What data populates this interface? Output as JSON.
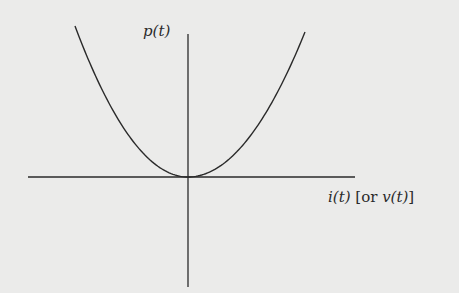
{
  "chart_data": {
    "type": "line",
    "title": "",
    "xlabel": "i(t) [or v(t)]",
    "ylabel": "p(t)",
    "xlabel_parts": {
      "main": "i(t)",
      "bracket_open": "[or ",
      "alt": "v(t)",
      "bracket_close": "]"
    },
    "series": [
      {
        "name": "p(t)",
        "relation": "p proportional to i^2 (or v^2)",
        "x": [
          -1.0,
          -0.75,
          -0.5,
          -0.25,
          0,
          0.25,
          0.5,
          0.75,
          1.0
        ],
        "values": [
          1.0,
          0.5625,
          0.25,
          0.0625,
          0,
          0.0625,
          0.25,
          0.5625,
          1.0
        ]
      }
    ],
    "grid": false,
    "ticks": false,
    "legend": null,
    "xlim": [
      -1.4,
      1.5
    ],
    "ylim": [
      -0.8,
      1.05
    ]
  },
  "colors": {
    "background": "#ebebea",
    "ink": "#2a2a2a"
  }
}
